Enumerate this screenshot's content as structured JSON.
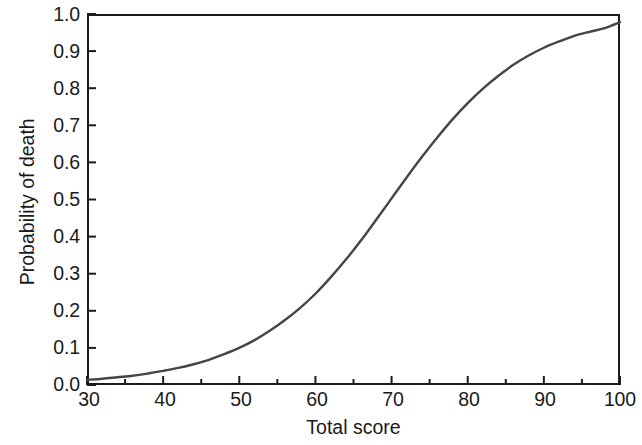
{
  "chart_data": {
    "type": "line",
    "title": "",
    "xlabel": "Total score",
    "ylabel": "Probability of death",
    "xlim": [
      30,
      100
    ],
    "ylim": [
      0.0,
      1.0
    ],
    "grid": false,
    "legend": null,
    "line_color": "#454545",
    "axis_color": "#1c1c1c",
    "xticks": [
      30,
      40,
      50,
      60,
      70,
      80,
      90,
      100
    ],
    "xtick_labels": [
      "30",
      "40",
      "50",
      "60",
      "70",
      "80",
      "90",
      "100"
    ],
    "x_minor_ticks": [
      35,
      45,
      55,
      65,
      75,
      85,
      95
    ],
    "yticks": [
      0.0,
      0.1,
      0.2,
      0.3,
      0.4,
      0.5,
      0.6,
      0.7,
      0.8,
      0.9,
      1.0
    ],
    "ytick_labels": [
      "0.0",
      "0.1",
      "0.2",
      "0.3",
      "0.4",
      "0.5",
      "0.6",
      "0.7",
      "0.8",
      "0.9",
      "1.0"
    ],
    "series": [
      {
        "name": "Probability of death",
        "x": [
          30,
          32,
          34,
          36,
          38,
          40,
          42,
          44,
          46,
          48,
          50,
          52,
          54,
          56,
          58,
          60,
          62,
          64,
          66,
          68,
          70,
          72,
          74,
          76,
          78,
          80,
          82,
          84,
          86,
          88,
          90,
          92,
          94,
          96,
          98,
          100
        ],
        "y": [
          0.014,
          0.017,
          0.021,
          0.025,
          0.031,
          0.038,
          0.046,
          0.056,
          0.068,
          0.083,
          0.1,
          0.121,
          0.146,
          0.175,
          0.208,
          0.246,
          0.29,
          0.338,
          0.39,
          0.446,
          0.503,
          0.56,
          0.615,
          0.667,
          0.716,
          0.76,
          0.799,
          0.833,
          0.863,
          0.888,
          0.909,
          0.926,
          0.941,
          0.952,
          0.962,
          0.978
        ]
      }
    ]
  }
}
